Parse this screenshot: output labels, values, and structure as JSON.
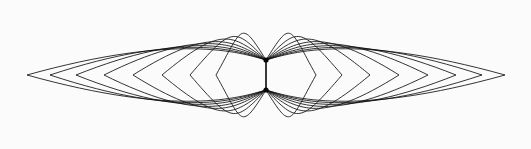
{
  "figure": {
    "type": "line-art",
    "background_color": "#fbfbfb",
    "stroke_color": "#111111",
    "node_color": "#060606",
    "canvas": {
      "width": 531,
      "height": 149
    },
    "axis": {
      "center_x": 266,
      "node_top_y": 60,
      "node_bottom_y": 90,
      "mid_y": 75
    },
    "extent": {
      "left_x": 27,
      "right_x": 505,
      "top_y": 16,
      "bottom_y": 135
    },
    "curve_count_per_side": 8,
    "curve_count_total": 16,
    "stroke_width": 0.85,
    "node_link_stroke_width": 1.6,
    "lobes": [
      "left",
      "right"
    ],
    "left_lobe": {
      "name": "left-lobe",
      "direction": -1,
      "curves": [
        {
          "index": 0,
          "apex_x": 27,
          "half_height": 44,
          "bulge": 0.96,
          "node_tilt": 0.02
        },
        {
          "index": 1,
          "apex_x": 50,
          "half_height": 47,
          "bulge": 0.94,
          "node_tilt": 0.06
        },
        {
          "index": 2,
          "apex_x": 76,
          "half_height": 50,
          "bulge": 0.92,
          "node_tilt": 0.12
        },
        {
          "index": 3,
          "apex_x": 104,
          "half_height": 53,
          "bulge": 0.9,
          "node_tilt": 0.2
        },
        {
          "index": 4,
          "apex_x": 133,
          "half_height": 55,
          "bulge": 0.88,
          "node_tilt": 0.3
        },
        {
          "index": 5,
          "apex_x": 162,
          "half_height": 57,
          "bulge": 0.86,
          "node_tilt": 0.43
        },
        {
          "index": 6,
          "apex_x": 190,
          "half_height": 58,
          "bulge": 0.84,
          "node_tilt": 0.58
        },
        {
          "index": 7,
          "apex_x": 216,
          "half_height": 59,
          "bulge": 0.82,
          "node_tilt": 0.76
        }
      ]
    },
    "right_lobe": {
      "name": "right-lobe",
      "direction": 1,
      "curves": [
        {
          "index": 0,
          "apex_x": 505,
          "half_height": 44,
          "bulge": 0.96,
          "node_tilt": 0.02
        },
        {
          "index": 1,
          "apex_x": 482,
          "half_height": 47,
          "bulge": 0.94,
          "node_tilt": 0.06
        },
        {
          "index": 2,
          "apex_x": 456,
          "half_height": 50,
          "bulge": 0.92,
          "node_tilt": 0.12
        },
        {
          "index": 3,
          "apex_x": 428,
          "half_height": 53,
          "bulge": 0.9,
          "node_tilt": 0.2
        },
        {
          "index": 4,
          "apex_x": 399,
          "half_height": 55,
          "bulge": 0.88,
          "node_tilt": 0.3
        },
        {
          "index": 5,
          "apex_x": 370,
          "half_height": 57,
          "bulge": 0.86,
          "node_tilt": 0.43
        },
        {
          "index": 6,
          "apex_x": 342,
          "half_height": 58,
          "bulge": 0.84,
          "node_tilt": 0.58
        },
        {
          "index": 7,
          "apex_x": 316,
          "half_height": 59,
          "bulge": 0.82,
          "node_tilt": 0.76
        }
      ]
    },
    "nodes": [
      {
        "name": "node-top",
        "x": 266,
        "y": 60,
        "radius": 2.6
      },
      {
        "name": "node-bottom",
        "x": 266,
        "y": 90,
        "radius": 2.6
      }
    ]
  }
}
